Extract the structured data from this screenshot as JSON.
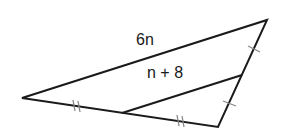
{
  "diagram": {
    "type": "triangle-midsegment",
    "labels": {
      "long_side": "6n",
      "midsegment": "n + 8"
    },
    "tick_marks": {
      "bottom_side": "double tick (congruent halves)",
      "right_side": "single tick (congruent halves)"
    },
    "colors": {
      "stroke": "#1a1a1a",
      "tick": "#888888",
      "background": "#ffffff"
    }
  }
}
